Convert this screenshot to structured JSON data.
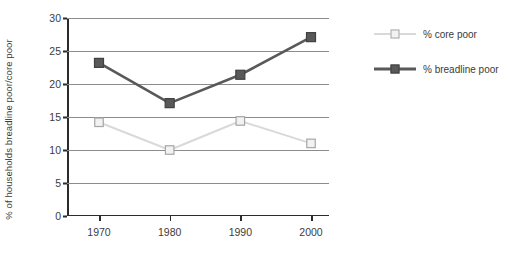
{
  "chart_data": {
    "type": "line",
    "title": "",
    "subtitle": "",
    "xlabel": "",
    "ylabel": "% of households breadline poor/core poor",
    "categories": [
      "1970",
      "1980",
      "1990",
      "2000"
    ],
    "x": [
      1970,
      1980,
      1990,
      2000
    ],
    "series": [
      {
        "name": "% core poor",
        "values": [
          14.2,
          10.0,
          14.4,
          11.0
        ],
        "color": "#d9d9d9",
        "marker": "open-square",
        "marker_fill": "#f2f2f2",
        "marker_edge": "#a6a6a6"
      },
      {
        "name": "% breadline poor",
        "values": [
          23.2,
          17.1,
          21.4,
          27.1
        ],
        "color": "#595959",
        "marker": "filled-square",
        "marker_fill": "#595959",
        "marker_edge": "#404040"
      }
    ],
    "ylim": [
      0,
      30
    ],
    "yticks": [
      0,
      5,
      10,
      15,
      20,
      25,
      30
    ],
    "ytick_labels": [
      "0",
      "5",
      "10",
      "15",
      "20",
      "25",
      "30"
    ],
    "xtick_labels": [
      "1970",
      "1980",
      "1990",
      "2000"
    ],
    "grid": true,
    "grid_axis": "y",
    "grid_color": "#8c8c8c",
    "axis_color": "#2b2b2b",
    "legend_position": "right",
    "background": "#ffffff"
  },
  "legend": {
    "entries": [
      {
        "label": "% core poor"
      },
      {
        "label": "% breadline poor"
      }
    ]
  }
}
